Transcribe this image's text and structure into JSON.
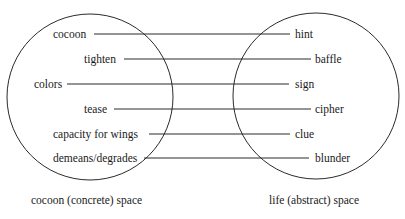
{
  "diagram": {
    "left_space": {
      "caption": "cocoon (concrete) space",
      "terms": [
        "cocoon",
        "tighten",
        "colors",
        "tease",
        "capacity for wings",
        "demeans/degrades"
      ]
    },
    "right_space": {
      "caption": "life (abstract) space",
      "terms": [
        "hint",
        "baffle",
        "sign",
        "cipher",
        "clue",
        "blunder"
      ]
    },
    "mappings": [
      {
        "from": "cocoon",
        "to": "hint"
      },
      {
        "from": "tighten",
        "to": "baffle"
      },
      {
        "from": "colors",
        "to": "sign"
      },
      {
        "from": "tease",
        "to": "cipher"
      },
      {
        "from": "capacity for wings",
        "to": "clue"
      },
      {
        "from": "demeans/degrades",
        "to": "blunder"
      }
    ]
  }
}
